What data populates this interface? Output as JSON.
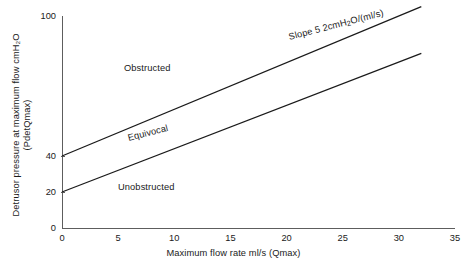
{
  "chart_data": {
    "type": "line",
    "title": "",
    "subtitle": "",
    "xlabel": "Maximum flow rate ml/s (Qmax)",
    "ylabel_line1": "Detrusor pressure at maximum flow cmH₂O",
    "ylabel_line2": "(PdetQmax)",
    "xlim": [
      0,
      35
    ],
    "ylim": [
      0,
      100
    ],
    "xticks": [
      0,
      5,
      10,
      15,
      20,
      25,
      30,
      35
    ],
    "xtick_labels": [
      "0",
      "5",
      "10",
      "15",
      "20",
      "25",
      "30",
      "35"
    ],
    "yticks": [
      0,
      20,
      40,
      100
    ],
    "ytick_labels": [
      "0",
      "20",
      "40",
      "100"
    ],
    "grid": false,
    "legend_position": "none",
    "series": [
      {
        "name": "Obstructed / Equivocal boundary",
        "intercept": 40,
        "slope": 2,
        "x": [
          0,
          32
        ],
        "values": [
          40,
          104
        ]
      },
      {
        "name": "Equivocal / Unobstructed boundary",
        "intercept": 20,
        "slope": 2,
        "x": [
          0,
          32
        ],
        "values": [
          20,
          84
        ]
      }
    ],
    "annotations": [
      {
        "id": "obstructed",
        "text": "Obstructed"
      },
      {
        "id": "equivocal",
        "text": "Equivocal"
      },
      {
        "id": "unobstructed",
        "text": "Unobstructed"
      },
      {
        "id": "slope",
        "text_pre": "Slope 5 2cmH",
        "text_sub": "2",
        "text_post": "O/(ml/s)"
      }
    ],
    "colors": {
      "line": "#1a1a1a",
      "axis": "#5d5d5d",
      "text": "#1a1a1a",
      "background": "#ffffff"
    }
  }
}
